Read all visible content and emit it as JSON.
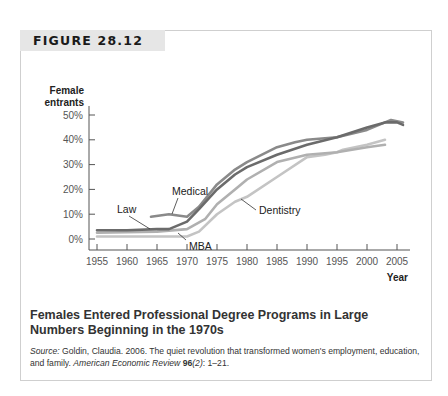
{
  "figure": {
    "label": "FIGURE 28.12",
    "caption_title": "Females Entered Professional Degree Programs in Large Numbers Beginning in the 1970s",
    "source": {
      "prefix": "Source:",
      "text": " Goldin, Claudia. 2006. The quiet revolution that transformed women's employment, education, and family. ",
      "journal": "American Economic Review",
      "volume": "96",
      "issue": "(2)",
      "pages": ": 1–21."
    }
  },
  "chart_data": {
    "type": "line",
    "title": "Females Entered Professional Degree Programs in Large Numbers Beginning in the 1970s",
    "xlabel": "Year",
    "ylabel": "Female entrants",
    "ylabel_lines": [
      "Female",
      "entrants"
    ],
    "xlim": [
      1955,
      2007
    ],
    "ylim": [
      0,
      50
    ],
    "x_ticks": [
      1955,
      1960,
      1965,
      1970,
      1975,
      1980,
      1985,
      1990,
      1995,
      2000,
      2005
    ],
    "y_ticks": [
      "0%",
      "10%",
      "20%",
      "30%",
      "40%",
      "50%"
    ],
    "y_tick_values": [
      0,
      10,
      20,
      30,
      40,
      50
    ],
    "grid": false,
    "legend": "inline labels",
    "series": [
      {
        "name": "Law",
        "color": "#6b6b6b",
        "x": [
          1955,
          1960,
          1965,
          1967,
          1969,
          1970,
          1972,
          1975,
          1978,
          1980,
          1985,
          1990,
          1995,
          2000,
          2003,
          2005,
          2006
        ],
        "values": [
          3.5,
          3.5,
          4,
          4,
          6,
          7,
          12,
          20,
          26,
          29,
          34,
          38,
          41,
          45,
          47,
          47,
          46
        ]
      },
      {
        "name": "Medical",
        "color": "#8a8a8a",
        "x": [
          1964,
          1967,
          1970,
          1972,
          1975,
          1978,
          1980,
          1985,
          1988,
          1990,
          1995,
          2000,
          2003,
          2004,
          2006
        ],
        "values": [
          9,
          10,
          9,
          13,
          22,
          28,
          31,
          37,
          39,
          40,
          41,
          44,
          47,
          48,
          47
        ]
      },
      {
        "name": "Dentistry",
        "color": "#c4c4c4",
        "x": [
          1955,
          1965,
          1970,
          1972,
          1975,
          1978,
          1980,
          1985,
          1990,
          1993,
          1995,
          1996,
          2000,
          2003
        ],
        "values": [
          1,
          1,
          1,
          3,
          10,
          15,
          17,
          25,
          33,
          34,
          35,
          36,
          38,
          40
        ]
      },
      {
        "name": "MBA",
        "color": "#b0b0b0",
        "x": [
          1955,
          1965,
          1970,
          1973,
          1975,
          1978,
          1980,
          1985,
          1990,
          1995,
          2000,
          2003
        ],
        "values": [
          2.5,
          3,
          4,
          8,
          14,
          20,
          24,
          31,
          34,
          35,
          37,
          38
        ]
      }
    ],
    "annotations": [
      {
        "text": "Medical",
        "series": "Medical"
      },
      {
        "text": "Law",
        "series": "Law"
      },
      {
        "text": "MBA",
        "series": "MBA"
      },
      {
        "text": "Dentistry",
        "series": "Dentistry"
      }
    ]
  }
}
